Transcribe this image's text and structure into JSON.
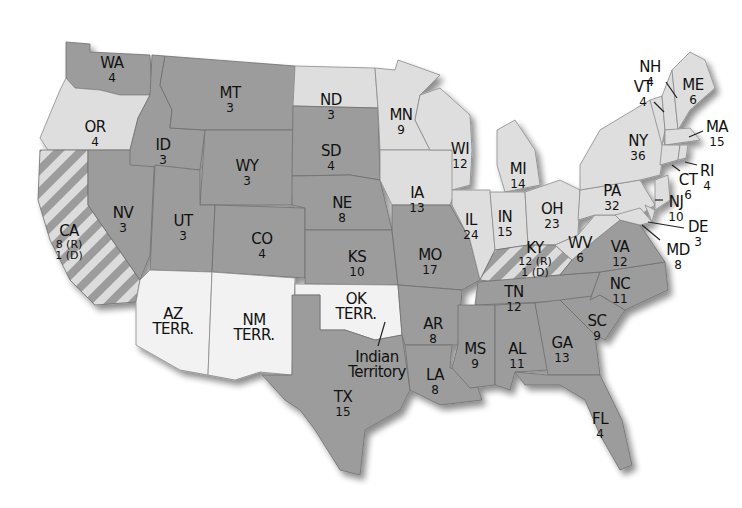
{
  "map": {
    "title": "",
    "legend_colors": {
      "republican": "#9c9c9c",
      "democrat": "#dedede",
      "split": "striped",
      "territory": "#f2f2f2"
    },
    "states": {
      "WA": {
        "abbr": "WA",
        "votes": "4"
      },
      "OR": {
        "abbr": "OR",
        "votes": "4"
      },
      "CA": {
        "abbr": "CA",
        "votes_r": "8 (R)",
        "votes_d": "1 (D)"
      },
      "NV": {
        "abbr": "NV",
        "votes": "3"
      },
      "ID": {
        "abbr": "ID",
        "votes": "3"
      },
      "MT": {
        "abbr": "MT",
        "votes": "3"
      },
      "WY": {
        "abbr": "WY",
        "votes": "3"
      },
      "UT": {
        "abbr": "UT",
        "votes": "3"
      },
      "CO": {
        "abbr": "CO",
        "votes": "4"
      },
      "AZ": {
        "abbr": "AZ",
        "terr": "TERR."
      },
      "NM": {
        "abbr": "NM",
        "terr": "TERR."
      },
      "ND": {
        "abbr": "ND",
        "votes": "3"
      },
      "SD": {
        "abbr": "SD",
        "votes": "4"
      },
      "NE": {
        "abbr": "NE",
        "votes": "8"
      },
      "KS": {
        "abbr": "KS",
        "votes": "10"
      },
      "OK": {
        "abbr": "OK",
        "terr": "TERR."
      },
      "indian_territory": {
        "line1": "Indian",
        "line2": "Territory"
      },
      "TX": {
        "abbr": "TX",
        "votes": "15"
      },
      "MN": {
        "abbr": "MN",
        "votes": "9"
      },
      "IA": {
        "abbr": "IA",
        "votes": "13"
      },
      "MO": {
        "abbr": "MO",
        "votes": "17"
      },
      "AR": {
        "abbr": "AR",
        "votes": "8"
      },
      "LA": {
        "abbr": "LA",
        "votes": "8"
      },
      "WI": {
        "abbr": "WI",
        "votes": "12"
      },
      "IL": {
        "abbr": "IL",
        "votes": "24"
      },
      "MI": {
        "abbr": "MI",
        "votes": "14"
      },
      "IN": {
        "abbr": "IN",
        "votes": "15"
      },
      "OH": {
        "abbr": "OH",
        "votes": "23"
      },
      "KY": {
        "abbr": "KY",
        "votes_r": "12 (R)",
        "votes_d": "1 (D)"
      },
      "TN": {
        "abbr": "TN",
        "votes": "12"
      },
      "MS": {
        "abbr": "MS",
        "votes": "9"
      },
      "AL": {
        "abbr": "AL",
        "votes": "11"
      },
      "GA": {
        "abbr": "GA",
        "votes": "13"
      },
      "FL": {
        "abbr": "FL",
        "votes": "4"
      },
      "SC": {
        "abbr": "SC",
        "votes": "9"
      },
      "NC": {
        "abbr": "NC",
        "votes": "11"
      },
      "VA": {
        "abbr": "VA",
        "votes": "12"
      },
      "WV": {
        "abbr": "WV",
        "votes": "6"
      },
      "PA": {
        "abbr": "PA",
        "votes": "32"
      },
      "NY": {
        "abbr": "NY",
        "votes": "36"
      },
      "VT": {
        "abbr": "VT",
        "votes": "4"
      },
      "NH": {
        "abbr": "NH",
        "votes": "4"
      },
      "ME": {
        "abbr": "ME",
        "votes": "6"
      },
      "MA": {
        "abbr": "MA",
        "votes": "15"
      },
      "RI": {
        "abbr": "RI",
        "votes": "4"
      },
      "CT": {
        "abbr": "CT",
        "votes": "6"
      },
      "NJ": {
        "abbr": "NJ",
        "votes": "10"
      },
      "DE": {
        "abbr": "DE",
        "votes": "3"
      },
      "MD": {
        "abbr": "MD",
        "votes": "8"
      }
    }
  }
}
